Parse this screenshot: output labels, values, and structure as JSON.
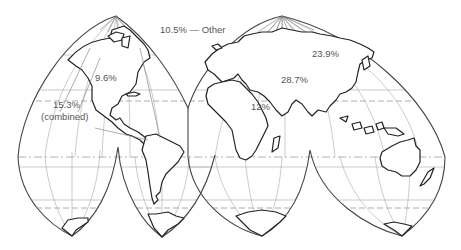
{
  "map": {
    "projection": "interrupted homolosine world map",
    "labels": {
      "other": "10.5% — Other",
      "north_america": "9.6%",
      "americas_combined_value": "15.3%",
      "americas_combined_note": "(combined)",
      "asia_north": "23.9%",
      "europe_middle_east": "28.7%",
      "africa": "12%"
    },
    "regions": [
      {
        "name": "North America",
        "share_percent": 9.6
      },
      {
        "name": "Latin America (combined)",
        "share_percent": 15.3
      },
      {
        "name": "Africa",
        "share_percent": 12
      },
      {
        "name": "Europe / Middle East",
        "share_percent": 28.7
      },
      {
        "name": "Asia",
        "share_percent": 23.9
      },
      {
        "name": "Other",
        "share_percent": 10.5
      }
    ]
  }
}
